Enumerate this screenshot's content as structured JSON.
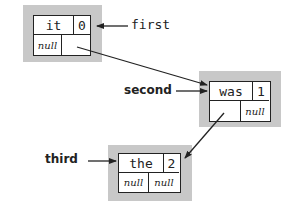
{
  "diagram": {
    "type": "linked-list",
    "nodes": [
      {
        "item": "it",
        "count": "0",
        "left": "null",
        "right": ""
      },
      {
        "item": "was",
        "count": "1",
        "left": "",
        "right": "null"
      },
      {
        "item": "the",
        "count": "2",
        "left": "null",
        "right": "null"
      }
    ],
    "references": [
      {
        "name": "first",
        "target": 0
      },
      {
        "name": "second",
        "target": 1
      },
      {
        "name": "third",
        "target": 2
      }
    ],
    "colors": {
      "shadow": "#c8c8c8",
      "line": "#222222"
    }
  }
}
